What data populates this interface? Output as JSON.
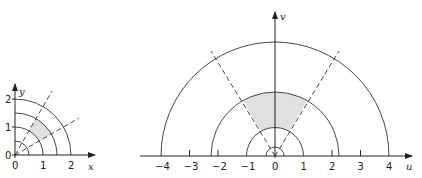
{
  "left_plot": {
    "x_axis_label": "x",
    "y_axis_label": "y",
    "x_ticks": [
      "0",
      "1",
      "2"
    ],
    "y_ticks": [
      "0",
      "1",
      "2"
    ],
    "circle_radii": [
      0.5,
      1,
      1.5,
      2
    ],
    "dashed_ray_angles_deg": [
      30,
      60
    ],
    "shaded_region": "1 ≤ r ≤ 1.5, 30° ≤ θ ≤ 60°"
  },
  "right_plot": {
    "u_axis_label": "u",
    "v_axis_label": "v",
    "u_ticks": [
      "−4",
      "−3",
      "−2",
      "−1",
      "0",
      "1",
      "2",
      "3",
      "4"
    ],
    "circle_radii": [
      0.25,
      1,
      2.25,
      4
    ],
    "dashed_ray_angles_deg": [
      60,
      120
    ],
    "shaded_region": "1 ≤ ρ ≤ 2.25, 60° ≤ φ ≤ 120°"
  },
  "colors": {
    "line": "#333333",
    "shade": "#e0e0e0"
  }
}
